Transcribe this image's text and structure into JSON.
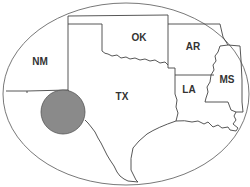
{
  "map": {
    "title": "",
    "colors": {
      "background": "#ffffff",
      "outline": "#555555",
      "border": "#444444",
      "highlight_fill": "#8a8a8a",
      "highlight_stroke": "#555555",
      "label": "#333333"
    },
    "states": [
      {
        "id": "NM",
        "label": "NM",
        "x": 40,
        "y": 62
      },
      {
        "id": "OK",
        "label": "OK",
        "x": 139,
        "y": 38
      },
      {
        "id": "AR",
        "label": "AR",
        "x": 193,
        "y": 47
      },
      {
        "id": "TX",
        "label": "TX",
        "x": 122,
        "y": 97
      },
      {
        "id": "LA",
        "label": "LA",
        "x": 189,
        "y": 90
      },
      {
        "id": "MS",
        "label": "MS",
        "x": 227,
        "y": 80
      }
    ],
    "highlight": {
      "shape": "circle",
      "cx": 63,
      "cy": 112,
      "r": 22,
      "region": "West Texas"
    }
  }
}
